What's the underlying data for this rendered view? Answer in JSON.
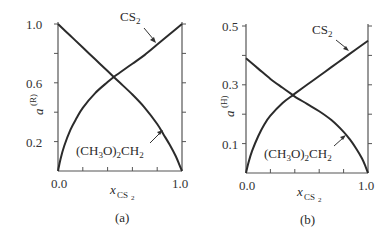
{
  "chart_data": [
    {
      "type": "line",
      "panel_label": "(a)",
      "xlabel": "x_CS2",
      "xlabel_main": "x",
      "xlabel_sub": "CS",
      "xlabel_subsub": "2",
      "ylabel": "a^(R)",
      "ylabel_main": "a",
      "ylabel_sup": "(R)",
      "xlim": [
        0.0,
        1.0
      ],
      "ylim": [
        0.0,
        1.0
      ],
      "x_tick_labels": [
        "0.0",
        "1.0"
      ],
      "x_ticks": [
        0.0,
        0.2,
        0.4,
        0.6,
        0.8,
        1.0
      ],
      "y_tick_labels": [
        "0.2",
        "0.6",
        "1.0"
      ],
      "y_ticks": [
        0.2,
        0.4,
        0.6,
        0.8,
        1.0
      ],
      "grid": false,
      "annotations": [
        "CS2",
        "(CH3O)2CH2"
      ],
      "series": [
        {
          "name": "CS2",
          "x": [
            0.0,
            0.02,
            0.05,
            0.1,
            0.15,
            0.2,
            0.3,
            0.4,
            0.45,
            0.5,
            0.6,
            0.7,
            0.8,
            0.9,
            1.0
          ],
          "y": [
            0.0,
            0.08,
            0.17,
            0.28,
            0.36,
            0.43,
            0.53,
            0.605,
            0.64,
            0.67,
            0.73,
            0.79,
            0.86,
            0.93,
            1.0
          ]
        },
        {
          "name": "(CH3O)2CH2",
          "x": [
            0.0,
            0.1,
            0.2,
            0.3,
            0.4,
            0.45,
            0.5,
            0.6,
            0.7,
            0.8,
            0.85,
            0.9,
            0.95,
            0.98,
            1.0
          ],
          "y": [
            1.0,
            0.92,
            0.84,
            0.76,
            0.68,
            0.64,
            0.6,
            0.52,
            0.43,
            0.32,
            0.25,
            0.18,
            0.1,
            0.04,
            0.0
          ]
        }
      ]
    },
    {
      "type": "line",
      "panel_label": "(b)",
      "xlabel": "x_CS2",
      "xlabel_main": "x",
      "xlabel_sub": "CS",
      "xlabel_subsub": "2",
      "ylabel": "a^(H)",
      "ylabel_main": "a",
      "ylabel_sup": "(H)",
      "xlim": [
        0.0,
        1.0
      ],
      "ylim": [
        0.0,
        0.5
      ],
      "x_tick_labels": [
        "0.0",
        "1.0"
      ],
      "x_ticks": [
        0.0,
        0.2,
        0.4,
        0.6,
        0.8,
        1.0
      ],
      "y_tick_labels": [
        "0.1",
        "0.3",
        "0.5"
      ],
      "y_ticks": [
        0.1,
        0.2,
        0.3,
        0.4,
        0.5
      ],
      "grid": false,
      "annotations": [
        "CS2",
        "(CH3O)2CH2"
      ],
      "series": [
        {
          "name": "CS2",
          "x": [
            0.0,
            0.02,
            0.05,
            0.1,
            0.15,
            0.2,
            0.3,
            0.385,
            0.4,
            0.5,
            0.6,
            0.7,
            0.8,
            0.9,
            1.0
          ],
          "y": [
            0.0,
            0.035,
            0.075,
            0.125,
            0.165,
            0.195,
            0.238,
            0.265,
            0.27,
            0.3,
            0.33,
            0.36,
            0.39,
            0.42,
            0.45
          ]
        },
        {
          "name": "(CH3O)2CH2",
          "x": [
            0.0,
            0.1,
            0.2,
            0.3,
            0.385,
            0.4,
            0.5,
            0.6,
            0.7,
            0.8,
            0.85,
            0.9,
            0.95,
            0.98,
            1.0
          ],
          "y": [
            0.39,
            0.355,
            0.32,
            0.29,
            0.265,
            0.26,
            0.235,
            0.21,
            0.18,
            0.14,
            0.115,
            0.085,
            0.05,
            0.022,
            0.0
          ]
        }
      ]
    }
  ]
}
